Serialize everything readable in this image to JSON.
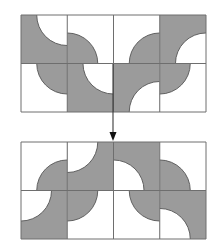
{
  "colors": {
    "background": "#ffffff",
    "fill_gray": "#9b9b9b",
    "line": "#3a3a3a",
    "grid_line": "#6e6e6e",
    "arc_line": "#555555"
  },
  "tile_size": {
    "w": 46.25,
    "h": 48.5
  },
  "arc_radius_ratio": 0.66,
  "grids": [
    {
      "name": "top-grid",
      "x": 21,
      "y": 15,
      "cols": 4,
      "rows": 2,
      "tiles": [
        {
          "row": 0,
          "col": 0,
          "base": "gray",
          "corner": "top-right"
        },
        {
          "row": 0,
          "col": 1,
          "base": "white",
          "corner": "bottom-left"
        },
        {
          "row": 0,
          "col": 2,
          "base": "white",
          "corner": "bottom-right"
        },
        {
          "row": 0,
          "col": 3,
          "base": "gray",
          "corner": "bottom-right"
        },
        {
          "row": 1,
          "col": 0,
          "base": "white",
          "corner": "top-right"
        },
        {
          "row": 1,
          "col": 1,
          "base": "gray",
          "corner": "top-right"
        },
        {
          "row": 1,
          "col": 2,
          "base": "gray",
          "corner": "bottom-right"
        },
        {
          "row": 1,
          "col": 3,
          "base": "white",
          "corner": "top-left"
        }
      ]
    },
    {
      "name": "bottom-grid",
      "x": 21,
      "y": 142,
      "cols": 4,
      "rows": 2,
      "tiles": [
        {
          "row": 0,
          "col": 0,
          "base": "white",
          "corner": "bottom-right"
        },
        {
          "row": 0,
          "col": 1,
          "base": "gray",
          "corner": "top-left"
        },
        {
          "row": 0,
          "col": 2,
          "base": "gray",
          "corner": "bottom-left"
        },
        {
          "row": 0,
          "col": 3,
          "base": "white",
          "corner": "bottom-left"
        },
        {
          "row": 1,
          "col": 0,
          "base": "gray",
          "corner": "top-left"
        },
        {
          "row": 1,
          "col": 1,
          "base": "white",
          "corner": "top-left"
        },
        {
          "row": 1,
          "col": 2,
          "base": "white",
          "corner": "top-right"
        },
        {
          "row": 1,
          "col": 3,
          "base": "gray",
          "corner": "bottom-left"
        }
      ]
    }
  ],
  "arrow": {
    "x": 113,
    "y1": 64,
    "y2": 141,
    "head_len": 9,
    "head_half_w": 3.5
  }
}
